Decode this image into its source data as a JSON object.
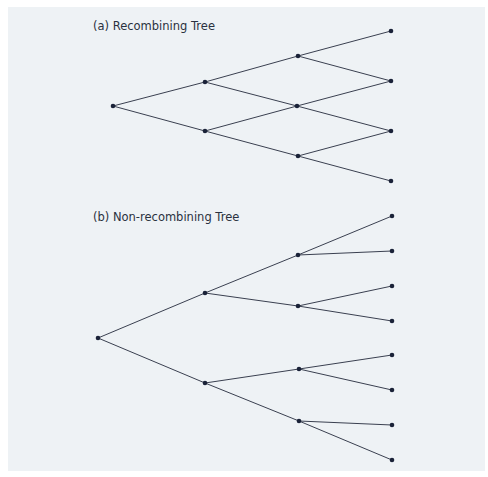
{
  "colors": {
    "background": "#eef2f5",
    "line": "#3a4050",
    "node": "#1a2238",
    "text": "#2a3140"
  },
  "diagrams": [
    {
      "id": "a",
      "title": "(a) Recombining Tree",
      "title_pos": [
        93,
        30
      ],
      "nodes": [
        {
          "id": "a0",
          "x": 113,
          "y": 106
        },
        {
          "id": "a1u",
          "x": 205,
          "y": 82
        },
        {
          "id": "a1d",
          "x": 205,
          "y": 131
        },
        {
          "id": "a2u",
          "x": 298,
          "y": 56
        },
        {
          "id": "a2m",
          "x": 297,
          "y": 106
        },
        {
          "id": "a2d",
          "x": 298,
          "y": 156
        },
        {
          "id": "a3a",
          "x": 391,
          "y": 31
        },
        {
          "id": "a3b",
          "x": 391,
          "y": 81
        },
        {
          "id": "a3c",
          "x": 391,
          "y": 131
        },
        {
          "id": "a3d",
          "x": 391,
          "y": 181
        }
      ],
      "edges": [
        [
          "a0",
          "a1u"
        ],
        [
          "a0",
          "a1d"
        ],
        [
          "a1u",
          "a2u"
        ],
        [
          "a1u",
          "a2m"
        ],
        [
          "a1d",
          "a2m"
        ],
        [
          "a1d",
          "a2d"
        ],
        [
          "a2u",
          "a3a"
        ],
        [
          "a2u",
          "a3b"
        ],
        [
          "a2m",
          "a3b"
        ],
        [
          "a2m",
          "a3c"
        ],
        [
          "a2d",
          "a3c"
        ],
        [
          "a2d",
          "a3d"
        ]
      ]
    },
    {
      "id": "b",
      "title": "(b) Non-recombining Tree",
      "title_pos": [
        93,
        221
      ],
      "nodes": [
        {
          "id": "b0",
          "x": 98,
          "y": 338
        },
        {
          "id": "b1u",
          "x": 205,
          "y": 293
        },
        {
          "id": "b1d",
          "x": 205,
          "y": 383
        },
        {
          "id": "b2a",
          "x": 298,
          "y": 255
        },
        {
          "id": "b2b",
          "x": 298,
          "y": 306
        },
        {
          "id": "b2c",
          "x": 299,
          "y": 369
        },
        {
          "id": "b2d",
          "x": 299,
          "y": 421
        },
        {
          "id": "b3a",
          "x": 392,
          "y": 216
        },
        {
          "id": "b3b",
          "x": 392,
          "y": 251
        },
        {
          "id": "b3c",
          "x": 392,
          "y": 286
        },
        {
          "id": "b3d",
          "x": 392,
          "y": 321
        },
        {
          "id": "b3e",
          "x": 392,
          "y": 355
        },
        {
          "id": "b3f",
          "x": 392,
          "y": 390
        },
        {
          "id": "b3g",
          "x": 392,
          "y": 425
        },
        {
          "id": "b3h",
          "x": 392,
          "y": 460
        }
      ],
      "edges": [
        [
          "b0",
          "b1u"
        ],
        [
          "b0",
          "b1d"
        ],
        [
          "b1u",
          "b2a"
        ],
        [
          "b1u",
          "b2b"
        ],
        [
          "b1d",
          "b2c"
        ],
        [
          "b1d",
          "b2d"
        ],
        [
          "b2a",
          "b3a"
        ],
        [
          "b2a",
          "b3b"
        ],
        [
          "b2b",
          "b3c"
        ],
        [
          "b2b",
          "b3d"
        ],
        [
          "b2c",
          "b3e"
        ],
        [
          "b2c",
          "b3f"
        ],
        [
          "b2d",
          "b3g"
        ],
        [
          "b2d",
          "b3h"
        ]
      ]
    }
  ]
}
